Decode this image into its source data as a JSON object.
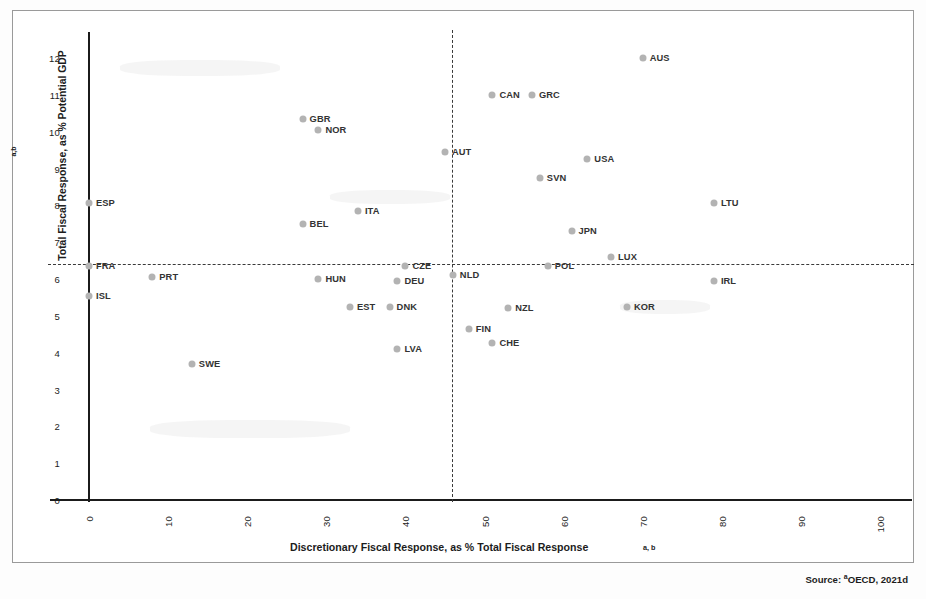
{
  "figure": {
    "source_note_prefix": "Source:",
    "source_note": "OECD, 2021d",
    "source_sup": "a"
  },
  "chart_data": {
    "type": "scatter",
    "title": "",
    "xlabel": "Discretionary Fiscal Response, as % Total Fiscal Response",
    "xlabel_sup": "a, b",
    "ylabel": "Total Fiscal Response, as % Potential GDP",
    "ylabel_sup": "a,b",
    "xlim": [
      0,
      100
    ],
    "ylim": [
      0,
      12.5
    ],
    "xticks": [
      "0",
      "10",
      "20",
      "30",
      "40",
      "50",
      "60",
      "70",
      "80",
      "90",
      "100"
    ],
    "xtick_values": [
      0,
      10,
      20,
      30,
      40,
      50,
      60,
      70,
      80,
      90,
      100
    ],
    "yticks": [
      "0",
      "1",
      "2",
      "3",
      "4",
      "5",
      "6",
      "7",
      "8",
      "9",
      "10",
      "11",
      "12"
    ],
    "ytick_values": [
      0,
      1,
      2,
      3,
      4,
      5,
      6,
      7,
      8,
      9,
      10,
      11,
      12
    ],
    "grid": false,
    "legend": "none",
    "marker_color": "#b3b3b3",
    "reference_lines": [
      {
        "orientation": "horizontal",
        "value": 6.35,
        "style": "dashed",
        "label": "mean total fiscal response"
      },
      {
        "orientation": "vertical",
        "value": 45,
        "style": "dashed",
        "label": "mean discretionary share"
      }
    ],
    "points": [
      {
        "label": "ESP",
        "x": 0,
        "y": 8.05,
        "label_side": "right"
      },
      {
        "label": "FRA",
        "x": 0,
        "y": 6.35,
        "label_side": "right"
      },
      {
        "label": "ISL",
        "x": 0,
        "y": 5.55,
        "label_side": "right"
      },
      {
        "label": "PRT",
        "x": 8,
        "y": 6.05,
        "label_side": "right"
      },
      {
        "label": "SWE",
        "x": 13,
        "y": 3.7,
        "label_side": "right"
      },
      {
        "label": "GBR",
        "x": 27,
        "y": 10.35,
        "label_side": "right"
      },
      {
        "label": "BEL",
        "x": 27,
        "y": 7.5,
        "label_side": "right"
      },
      {
        "label": "NOR",
        "x": 29,
        "y": 10.05,
        "label_side": "right"
      },
      {
        "label": "HUN",
        "x": 29,
        "y": 6.0,
        "label_side": "right"
      },
      {
        "label": "EST",
        "x": 33,
        "y": 5.25,
        "label_side": "right"
      },
      {
        "label": "ITA",
        "x": 34,
        "y": 7.85,
        "label_side": "right"
      },
      {
        "label": "DNK",
        "x": 38,
        "y": 5.25,
        "label_side": "right"
      },
      {
        "label": "DEU",
        "x": 39,
        "y": 5.95,
        "label_side": "right"
      },
      {
        "label": "CZE",
        "x": 40,
        "y": 6.35,
        "label_side": "right"
      },
      {
        "label": "LVA",
        "x": 39,
        "y": 4.1,
        "label_side": "right"
      },
      {
        "label": "AUT",
        "x": 45,
        "y": 9.45,
        "label_side": "right"
      },
      {
        "label": "NLD",
        "x": 46,
        "y": 6.1,
        "label_side": "right"
      },
      {
        "label": "FIN",
        "x": 48,
        "y": 4.65,
        "label_side": "right"
      },
      {
        "label": "CHE",
        "x": 51,
        "y": 4.25,
        "label_side": "right"
      },
      {
        "label": "CAN",
        "x": 51,
        "y": 11.0,
        "label_side": "right"
      },
      {
        "label": "NZL",
        "x": 53,
        "y": 5.2,
        "label_side": "right"
      },
      {
        "label": "GRC",
        "x": 56,
        "y": 11.0,
        "label_side": "right"
      },
      {
        "label": "SVN",
        "x": 57,
        "y": 8.75,
        "label_side": "right"
      },
      {
        "label": "JPN",
        "x": 61,
        "y": 7.3,
        "label_side": "right"
      },
      {
        "label": "USA",
        "x": 63,
        "y": 9.25,
        "label_side": "right"
      },
      {
        "label": "POL",
        "x": 58,
        "y": 6.35,
        "label_side": "right"
      },
      {
        "label": "LUX",
        "x": 66,
        "y": 6.6,
        "label_side": "right"
      },
      {
        "label": "KOR",
        "x": 68,
        "y": 5.25,
        "label_side": "right"
      },
      {
        "label": "AUS",
        "x": 70,
        "y": 12.0,
        "label_side": "right"
      },
      {
        "label": "IRL",
        "x": 79,
        "y": 5.95,
        "label_side": "right"
      },
      {
        "label": "LTU",
        "x": 79,
        "y": 8.05,
        "label_side": "right"
      }
    ]
  }
}
